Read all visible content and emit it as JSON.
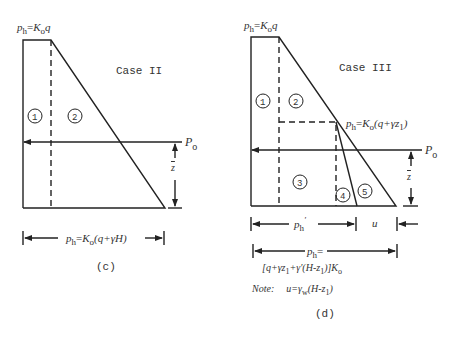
{
  "figure_c": {
    "top_label": {
      "p": "p",
      "h": "h",
      "eq": "=",
      "K": "K",
      "o": "o",
      "q": "q"
    },
    "case_label": "Case II",
    "region_labels": [
      "1",
      "2"
    ],
    "resultant_label": {
      "P": "P",
      "o": "o"
    },
    "zbar_label": "z",
    "bottom_label": {
      "p": "p",
      "h": "h",
      "eq": "=",
      "K": "K",
      "o": "o",
      "rest": "(q+γH)"
    },
    "caption": "(c)"
  },
  "figure_d": {
    "top_label": {
      "p": "p",
      "h": "h",
      "eq": "=",
      "K": "K",
      "o": "o",
      "q": "q"
    },
    "case_label": "Case III",
    "region_labels": [
      "1",
      "2",
      "3",
      "4",
      "5"
    ],
    "kink_label": {
      "p": "p",
      "h": "h",
      "eq": "=",
      "K": "K",
      "o": "o",
      "rest": "(q+γz",
      "sub": "1",
      "close": ")"
    },
    "resultant_label": {
      "P": "P",
      "o": "o"
    },
    "zbar_label": "z",
    "ph_prime_label": {
      "p": "p",
      "h": "h",
      "prime": "′"
    },
    "u_label": "u",
    "total_label_line1": {
      "p": "p",
      "h": "h",
      "eq": "="
    },
    "total_label_line2": {
      "a": "[q+γz",
      "s1": "1",
      "b": "+γ′(H-z",
      "s2": "1",
      "c": ")]K",
      "s3": "o"
    },
    "note": {
      "prefix": "Note:",
      "a": "u=γ",
      "w": "w",
      "b": "(H-z",
      "s": "1",
      "c": ")"
    },
    "caption": "(d)"
  }
}
